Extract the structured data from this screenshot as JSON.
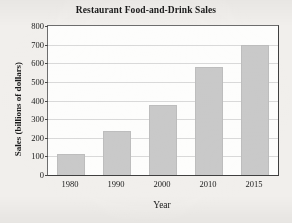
{
  "chart_data": {
    "type": "bar",
    "title": "Restaurant Food-and-Drink Sales",
    "xlabel": "Year",
    "ylabel": "Sales (billions of dollars)",
    "categories": [
      "1980",
      "1990",
      "2000",
      "2010",
      "2015"
    ],
    "values": [
      115,
      235,
      375,
      580,
      700
    ],
    "series": [
      {
        "name": "Sales",
        "values": [
          115,
          235,
          375,
          580,
          700
        ]
      }
    ],
    "ylim": [
      0,
      800
    ],
    "y_ticks": [
      0,
      100,
      200,
      300,
      400,
      500,
      600,
      700,
      800
    ],
    "y_tick_labels": [
      "0",
      "100",
      "200",
      "300",
      "400",
      "500",
      "600",
      "700",
      "800"
    ],
    "grid": true,
    "grid_axis": "y",
    "legend": false,
    "legend_position": "none",
    "bar_color": "#c9c9c9",
    "bar_edge_color": "#bdbdbd",
    "grid_color": "#d9d9d9",
    "axis_color": "#3f3f3f",
    "text_color": "#1a1a1a",
    "plot_background": "#fdfdfc",
    "page_background": "#f1efec"
  }
}
